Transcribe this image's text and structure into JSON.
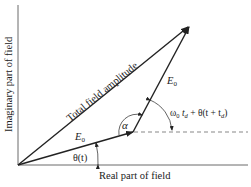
{
  "diagram": {
    "x_axis_label": "Real part of field",
    "y_axis_label": "Imaginary part of field",
    "total_label": "Total field amplitude",
    "vector1_label": "E",
    "vector1_sub": "0",
    "vector2_label": "E",
    "vector2_sub": "0",
    "theta_label": "θ(t)",
    "alpha_label": "α",
    "phase_label_omega": "ω",
    "phase_label_sub0": "0",
    "phase_label_t": " t",
    "phase_label_subd": "d",
    "phase_label_rest": " + θ(t + t",
    "phase_label_subd2": "d",
    "phase_label_close": ")"
  }
}
